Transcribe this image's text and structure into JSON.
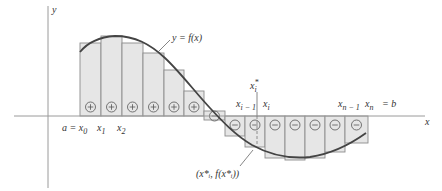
{
  "diagram": {
    "colors": {
      "axis": "#9a9a9a",
      "curve": "#444444",
      "rect_fill": "#e6e6e6",
      "rect_stroke": "#8c8c8c",
      "text": "#333333"
    },
    "axes": {
      "x_label": "x",
      "y_label": "y",
      "origin_x": 48,
      "baseline_y": 116
    },
    "curve_label": "y = f(x)",
    "rectangles": [
      {
        "x": 80,
        "w": 21,
        "h": 73,
        "sign": "+"
      },
      {
        "x": 101,
        "w": 21,
        "h": 80,
        "sign": "+"
      },
      {
        "x": 122,
        "w": 21,
        "h": 73,
        "sign": "+"
      },
      {
        "x": 143,
        "w": 21,
        "h": 63,
        "sign": "+"
      },
      {
        "x": 164,
        "w": 20,
        "h": 46,
        "sign": "+"
      },
      {
        "x": 184,
        "w": 20,
        "h": 25,
        "sign": "+"
      },
      {
        "x": 204,
        "w": 21,
        "h": -5,
        "sign": "-",
        "straddle": true
      },
      {
        "x": 225,
        "w": 20,
        "h": -20,
        "sign": "-"
      },
      {
        "x": 245,
        "w": 20,
        "h": -31,
        "sign": "-"
      },
      {
        "x": 265,
        "w": 20,
        "h": -42,
        "sign": "-"
      },
      {
        "x": 285,
        "w": 20,
        "h": -44,
        "sign": "-"
      },
      {
        "x": 305,
        "w": 20,
        "h": -42,
        "sign": "-"
      },
      {
        "x": 325,
        "w": 20,
        "h": -36,
        "sign": "-"
      },
      {
        "x": 345,
        "w": 23,
        "h": -27,
        "sign": "-"
      }
    ],
    "tick_labels": [
      {
        "text": "a = x",
        "sub": "0",
        "x": 62,
        "y": 131
      },
      {
        "text": "x",
        "sub": "1",
        "x": 97,
        "y": 131
      },
      {
        "text": "x",
        "sub": "2",
        "x": 117,
        "y": 131
      },
      {
        "text": "x",
        "sub": "i − 1",
        "x": 236,
        "y": 107
      },
      {
        "text": "x",
        "sub": "i",
        "x": 263,
        "y": 107
      },
      {
        "text": "x",
        "sub": "n − 1",
        "x": 338,
        "y": 107
      },
      {
        "text": "x",
        "sub": "n",
        "x": 365,
        "y": 107
      }
    ],
    "xn_eq": "= b",
    "sample_point": {
      "label": "x",
      "sub": "i",
      "sup": "*",
      "x": 255,
      "point_label": "(x*ᵢ, f(x*ᵢ))"
    }
  }
}
